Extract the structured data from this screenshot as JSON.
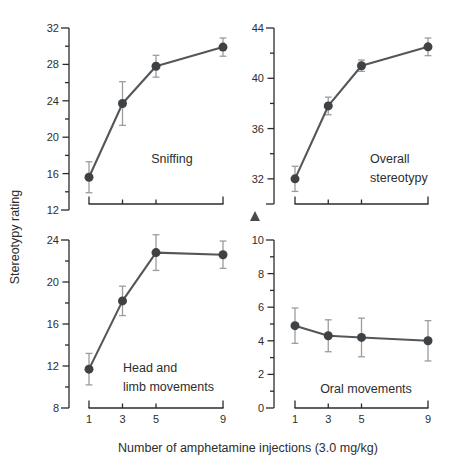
{
  "figure": {
    "ylabel": "Stereotypy rating",
    "xlabel": "Number of amphetamine injections (3.0 mg/kg)",
    "annotations": {
      "triangle_marker": "triangle-up"
    },
    "colors": {
      "background": "#ffffff",
      "axis": "#2b2b2b",
      "tick_text": "#2e2e2e",
      "line": "#54575a",
      "marker": "#3f4245",
      "error_bar": "#9c9c9c"
    }
  },
  "chart_data": [
    {
      "type": "line",
      "panel": "top_left",
      "title": "Sniffing",
      "x": [
        1,
        3,
        5,
        9
      ],
      "values": [
        15.6,
        23.7,
        27.8,
        29.9
      ],
      "errors": [
        1.7,
        2.4,
        1.2,
        1.0
      ],
      "ylim": [
        12,
        32
      ],
      "yticks": [
        12,
        16,
        20,
        24,
        28,
        32
      ],
      "yminor": 2,
      "xlim": [
        1,
        9
      ],
      "xticks": [
        1,
        3,
        5,
        9
      ],
      "show_x_tick_labels": false
    },
    {
      "type": "line",
      "panel": "top_right",
      "title": "Overall\nstereotypy",
      "x": [
        1,
        3,
        5,
        9
      ],
      "values": [
        32.0,
        37.8,
        41.0,
        42.5
      ],
      "errors": [
        1.0,
        0.7,
        0.45,
        0.7
      ],
      "ylim": [
        30,
        44
      ],
      "yticks": [
        32,
        36,
        40,
        44
      ],
      "yminor": 2,
      "xlim": [
        1,
        9
      ],
      "xticks": [
        1,
        3,
        5,
        9
      ],
      "show_x_tick_labels": false
    },
    {
      "type": "line",
      "panel": "bottom_left",
      "title": "Head and\nlimb movements",
      "x": [
        1,
        3,
        5,
        9
      ],
      "values": [
        11.7,
        18.2,
        22.8,
        22.6
      ],
      "errors": [
        1.5,
        1.4,
        1.7,
        1.3
      ],
      "ylim": [
        8,
        24
      ],
      "yticks": [
        8,
        12,
        16,
        20,
        24
      ],
      "yminor": 2,
      "xlim": [
        1,
        9
      ],
      "xticks": [
        1,
        3,
        5,
        9
      ],
      "show_x_tick_labels": true
    },
    {
      "type": "line",
      "panel": "bottom_right",
      "title": "Oral movements",
      "x": [
        1,
        3,
        5,
        9
      ],
      "values": [
        4.9,
        4.3,
        4.2,
        4.0
      ],
      "errors": [
        1.05,
        0.95,
        1.15,
        1.2
      ],
      "ylim": [
        0,
        10
      ],
      "yticks": [
        0,
        2,
        4,
        6,
        8,
        10
      ],
      "yminor": 1,
      "xlim": [
        1,
        9
      ],
      "xticks": [
        1,
        3,
        5,
        9
      ],
      "show_x_tick_labels": true
    }
  ]
}
